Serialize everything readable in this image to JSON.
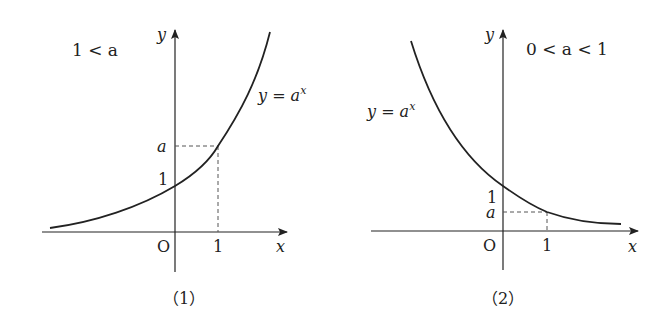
{
  "figure": {
    "panels": [
      {
        "id": "1",
        "caption": "（1）",
        "condition": "1 < a",
        "function_label_y": "y = a",
        "function_label_sup": "x",
        "axis_x_label": "x",
        "axis_y_label": "y",
        "origin_label": "O",
        "tick_x_label": "1",
        "tick_y_one_label": "1",
        "tick_y_a_label": "a",
        "curve": "increasing exponential"
      },
      {
        "id": "2",
        "caption": "（2）",
        "condition": "0 < a < 1",
        "function_label_y": "y = a",
        "function_label_sup": "x",
        "axis_x_label": "x",
        "axis_y_label": "y",
        "origin_label": "O",
        "tick_x_label": "1",
        "tick_y_one_label": "1",
        "tick_y_a_label": "a",
        "curve": "decreasing exponential"
      }
    ],
    "colors": {
      "line": "#222222",
      "dashed": "#555555",
      "background": "#ffffff"
    }
  }
}
